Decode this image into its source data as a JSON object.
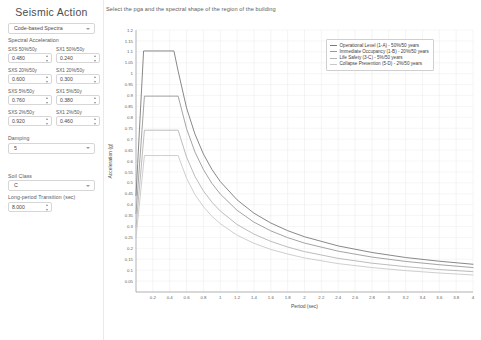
{
  "sidebar": {
    "panel_title": "Seismic Action",
    "spectra_select": {
      "label": "",
      "value": "Code-based Spectra",
      "caret": "chevron-down-icon"
    },
    "spectral_acceleration_label": "Spectral Acceleration",
    "params": [
      {
        "label": "SXS 50%/50y",
        "value": "0.480"
      },
      {
        "label": "SX1 50%/50y",
        "value": "0.240"
      },
      {
        "label": "SXS 20%/50y",
        "value": "0.600"
      },
      {
        "label": "SX1 20%/50y",
        "value": "0.300"
      },
      {
        "label": "SXS  5%/50y",
        "value": "0.760"
      },
      {
        "label": "SX1  5%/50y",
        "value": "0.380"
      },
      {
        "label": "SXS  2%/50y",
        "value": "0.920"
      },
      {
        "label": "SX1  2%/50y",
        "value": "0.460"
      }
    ],
    "damping": {
      "label": "Damping",
      "value": "5"
    },
    "soil_class": {
      "label": "Soil Class",
      "value": "C"
    },
    "long_period": {
      "label": "Long-period Transition (sec)",
      "value": "8.000"
    }
  },
  "main": {
    "instruction": "Select the pga and the spectral shape of the region of the building"
  },
  "chart_data": {
    "type": "line",
    "title": "",
    "xlabel": "Period (sec)",
    "ylabel": "Acceleration (g)",
    "xlim": [
      0,
      4
    ],
    "ylim": [
      0,
      1.2
    ],
    "xticks": [
      0.2,
      0.4,
      0.6,
      0.8,
      1,
      1.2,
      1.4,
      1.6,
      1.8,
      2,
      2.2,
      2.4,
      2.6,
      2.8,
      3,
      3.2,
      3.4,
      3.6,
      3.8,
      4
    ],
    "yticks": [
      0.05,
      0.1,
      0.15,
      0.2,
      0.25,
      0.3,
      0.35,
      0.4,
      0.45,
      0.5,
      0.55,
      0.6,
      0.65,
      0.7,
      0.75,
      0.8,
      0.85,
      0.9,
      0.95,
      1,
      1.05,
      1.1,
      1.15,
      1.2
    ],
    "grid": true,
    "legend_position": "upper right",
    "series": [
      {
        "name": "Operational Level (1-A) - 50%/50 years",
        "color": "#7a7a7a",
        "sds": 0.48,
        "sd1": 0.24,
        "plateau": 1.104,
        "t0": 0.09,
        "ts": 0.45,
        "tl": 8.0,
        "x": [
          0,
          0.02,
          0.05,
          0.09,
          0.2,
          0.3,
          0.45,
          0.5,
          0.6,
          0.7,
          0.8,
          0.9,
          1.0,
          1.2,
          1.4,
          1.6,
          1.8,
          2.0,
          2.4,
          2.8,
          3.2,
          3.6,
          4.0
        ],
        "y": [
          0.442,
          0.589,
          0.81,
          1.104,
          1.104,
          1.104,
          1.104,
          1.012,
          0.843,
          0.723,
          0.632,
          0.562,
          0.506,
          0.422,
          0.361,
          0.316,
          0.281,
          0.253,
          0.211,
          0.181,
          0.158,
          0.141,
          0.127
        ]
      },
      {
        "name": "Immediate Occupancy (1-B) - 20%/50 years",
        "color": "#9a9a9a",
        "sds": 0.6,
        "sd1": 0.3,
        "plateau": 0.897,
        "t0": 0.1,
        "ts": 0.5,
        "tl": 8.0,
        "x": [
          0,
          0.02,
          0.05,
          0.1,
          0.2,
          0.3,
          0.5,
          0.6,
          0.7,
          0.8,
          0.9,
          1.0,
          1.2,
          1.4,
          1.6,
          1.8,
          2.0,
          2.4,
          2.8,
          3.2,
          3.6,
          4.0
        ],
        "y": [
          0.359,
          0.466,
          0.627,
          0.897,
          0.897,
          0.897,
          0.897,
          0.748,
          0.641,
          0.561,
          0.498,
          0.449,
          0.374,
          0.32,
          0.28,
          0.249,
          0.224,
          0.187,
          0.16,
          0.14,
          0.125,
          0.112
        ]
      },
      {
        "name": "Life Safety (3-C) -  5%/50 years",
        "color": "#b4b4b4",
        "sds": 0.76,
        "sd1": 0.38,
        "plateau": 0.741,
        "t0": 0.1,
        "ts": 0.5,
        "tl": 8.0,
        "x": [
          0,
          0.02,
          0.05,
          0.1,
          0.2,
          0.3,
          0.5,
          0.6,
          0.7,
          0.8,
          0.9,
          1.0,
          1.2,
          1.4,
          1.6,
          1.8,
          2.0,
          2.4,
          2.8,
          3.2,
          3.6,
          4.0
        ],
        "y": [
          0.296,
          0.385,
          0.518,
          0.741,
          0.741,
          0.741,
          0.741,
          0.618,
          0.529,
          0.463,
          0.412,
          0.371,
          0.309,
          0.265,
          0.232,
          0.206,
          0.185,
          0.154,
          0.132,
          0.116,
          0.103,
          0.093
        ]
      },
      {
        "name": "Collapse Prevention (5-D) -  2%/50 years",
        "color": "#c8c8c8",
        "sds": 0.92,
        "sd1": 0.46,
        "plateau": 0.625,
        "t0": 0.1,
        "ts": 0.5,
        "tl": 8.0,
        "x": [
          0,
          0.02,
          0.05,
          0.1,
          0.2,
          0.3,
          0.5,
          0.6,
          0.7,
          0.8,
          0.9,
          1.0,
          1.2,
          1.4,
          1.6,
          1.8,
          2.0,
          2.4,
          2.8,
          3.2,
          3.6,
          4.0
        ],
        "y": [
          0.25,
          0.325,
          0.438,
          0.625,
          0.625,
          0.625,
          0.625,
          0.521,
          0.446,
          0.391,
          0.347,
          0.313,
          0.26,
          0.223,
          0.195,
          0.174,
          0.156,
          0.13,
          0.112,
          0.098,
          0.087,
          0.078
        ]
      }
    ]
  }
}
